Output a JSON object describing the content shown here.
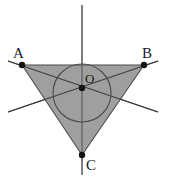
{
  "figure": {
    "background_color": "#ffffff",
    "canvas": {
      "width": 170,
      "height": 178
    }
  },
  "colors": {
    "triangle_fill": "#9a9a9a",
    "triangle_stroke": "#4a4a4a",
    "line_stroke": "#3c3c3c",
    "circle_stroke": "#4a4a4a",
    "point_fill": "#141414",
    "label_color": "#1a1a1a"
  },
  "labels": {
    "a": "A",
    "b": "B",
    "c": "C",
    "o": "O"
  },
  "points": {
    "A": {
      "x": 22,
      "y": 65,
      "label": "A",
      "label_x": 13,
      "label_y": 58
    },
    "B": {
      "x": 144,
      "y": 65,
      "label": "B",
      "label_x": 142,
      "label_y": 58
    },
    "C": {
      "x": 82,
      "y": 155,
      "label": "C",
      "label_x": 86,
      "label_y": 170
    },
    "O": {
      "x": 82,
      "y": 88,
      "label": "O",
      "label_x": 85,
      "label_y": 83
    }
  },
  "geometry": {
    "triangle_path": "M 22,65 L 144,65 L 82,155 Z",
    "incircle": {
      "cx": 82,
      "cy": 93,
      "r": 29
    },
    "cevian_vertical": {
      "x1": 82,
      "y1": 5,
      "x2": 82,
      "y2": 175
    },
    "cevian_from_a": {
      "x1": 8,
      "y1": 112,
      "x2": 158,
      "y2": 61
    },
    "cevian_from_b": {
      "x1": 158,
      "y1": 112,
      "x2": 8,
      "y2": 61
    },
    "point_radius": 3.2,
    "stroke_width": 1.1
  }
}
